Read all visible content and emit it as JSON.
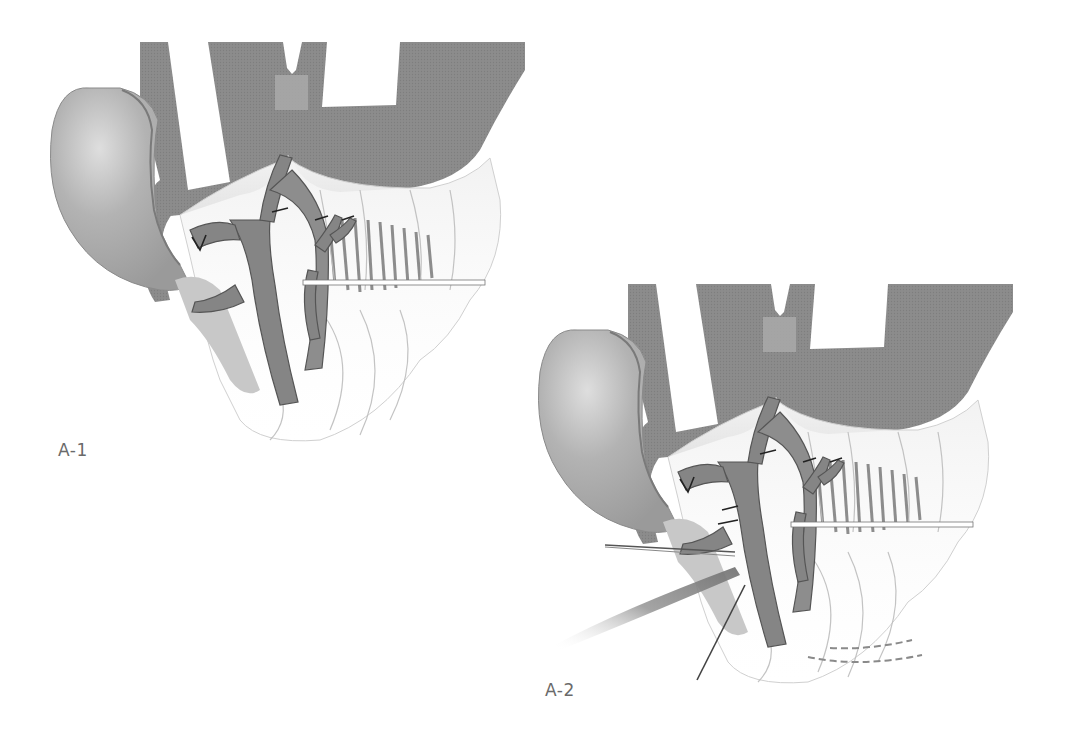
{
  "figure": {
    "panels": [
      {
        "id": "A-1",
        "label": "A-1",
        "offset": [
          0,
          0
        ]
      },
      {
        "id": "A-2",
        "label": "A-2",
        "offset": [
          488,
          242
        ]
      }
    ]
  },
  "colors": {
    "dark_tissue": "#8c8c8c",
    "vessel": "#858585",
    "vessel_outline": "#555555",
    "light_tissue": "#bdbdbd",
    "ear": "#a8a8a8",
    "ear_highlight": "#d8d8d8",
    "pad": "#a9a9a9",
    "fascia": "#e6e6e6",
    "muscle_fibers": "#7a7a7a",
    "background": "#ffffff",
    "label_text": "#6a6a6a"
  }
}
